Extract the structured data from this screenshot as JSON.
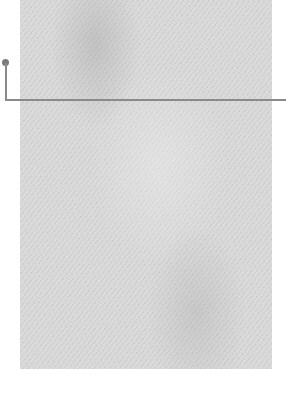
{
  "swatch": {
    "texture": "paper-grain",
    "base_color": "#d8d8d8"
  },
  "leader_line": {
    "color": "#8a8a8a",
    "dot_color": "#7a7a7a"
  }
}
